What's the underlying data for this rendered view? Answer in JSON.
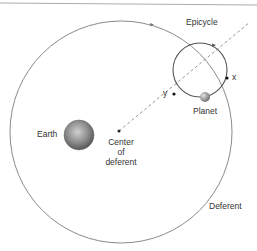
{
  "diagram": {
    "labels": {
      "epicycle": "Epicycle",
      "x": "x",
      "y": "y",
      "planet": "Planet",
      "earth": "Earth",
      "center_line1": "Center",
      "center_line2": "of",
      "center_line3": "deferent",
      "deferent": "Deferent"
    },
    "colors": {
      "circle": "#8a8a8a",
      "epicycle": "#555555",
      "dashed": "#888888",
      "top_rule": "#aaaaaa"
    }
  }
}
